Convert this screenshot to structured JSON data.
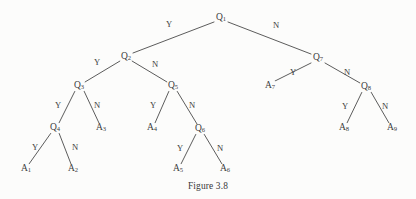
{
  "figure": {
    "caption": "Figure 3.8",
    "type": "binary-decision-tree",
    "background_color": "#fcfcfb",
    "line_color": "#4a4a4a",
    "text_color": "#3d3d3d",
    "width": 416,
    "height": 199
  },
  "nodes": [
    {
      "id": "q1",
      "label": "Q",
      "sub": "1",
      "kind": "question",
      "x": 221,
      "y": 18
    },
    {
      "id": "q2",
      "label": "Q",
      "sub": "2",
      "kind": "question",
      "x": 126,
      "y": 57
    },
    {
      "id": "q3",
      "label": "Q",
      "sub": "3",
      "kind": "question",
      "x": 79,
      "y": 86
    },
    {
      "id": "q4",
      "label": "Q",
      "sub": "4",
      "kind": "question",
      "x": 55,
      "y": 128
    },
    {
      "id": "q5",
      "label": "Q",
      "sub": "5",
      "kind": "question",
      "x": 173,
      "y": 86
    },
    {
      "id": "q6",
      "label": "Q",
      "sub": "6",
      "kind": "question",
      "x": 200,
      "y": 129
    },
    {
      "id": "q7",
      "label": "Q",
      "sub": "7",
      "kind": "question",
      "x": 318,
      "y": 58
    },
    {
      "id": "q8",
      "label": "Q",
      "sub": "8",
      "kind": "question",
      "x": 366,
      "y": 87
    },
    {
      "id": "a1",
      "label": "A",
      "sub": "1",
      "kind": "answer",
      "x": 26,
      "y": 169
    },
    {
      "id": "a2",
      "label": "A",
      "sub": "2",
      "kind": "answer",
      "x": 73,
      "y": 169
    },
    {
      "id": "a3",
      "label": "A",
      "sub": "3",
      "kind": "answer",
      "x": 101,
      "y": 128
    },
    {
      "id": "a4",
      "label": "A",
      "sub": "4",
      "kind": "answer",
      "x": 152,
      "y": 128
    },
    {
      "id": "a5",
      "label": "A",
      "sub": "5",
      "kind": "answer",
      "x": 178,
      "y": 169
    },
    {
      "id": "a6",
      "label": "A",
      "sub": "6",
      "kind": "answer",
      "x": 225,
      "y": 169
    },
    {
      "id": "a7",
      "label": "A",
      "sub": "7",
      "kind": "answer",
      "x": 270,
      "y": 86
    },
    {
      "id": "a8",
      "label": "A",
      "sub": "8",
      "kind": "answer",
      "x": 344,
      "y": 128
    },
    {
      "id": "a9",
      "label": "A",
      "sub": "9",
      "kind": "answer",
      "x": 392,
      "y": 128
    }
  ],
  "edges": [
    {
      "id": "e-q1-q2",
      "from": "q1",
      "to": "q2",
      "label": "Y",
      "lx": 169,
      "ly": 24,
      "x1": 214,
      "y1": 22,
      "x2": 133,
      "y2": 53
    },
    {
      "id": "e-q1-q7",
      "from": "q1",
      "to": "q7",
      "label": "N",
      "lx": 276,
      "ly": 25,
      "x1": 228,
      "y1": 22,
      "x2": 311,
      "y2": 54
    },
    {
      "id": "e-q2-q3",
      "from": "q2",
      "to": "q3",
      "label": "Y",
      "lx": 97,
      "ly": 62,
      "x1": 120,
      "y1": 61,
      "x2": 85,
      "y2": 82
    },
    {
      "id": "e-q2-q5",
      "from": "q2",
      "to": "q5",
      "label": "N",
      "lx": 155,
      "ly": 64,
      "x1": 132,
      "y1": 61,
      "x2": 167,
      "y2": 82
    },
    {
      "id": "e-q3-q4",
      "from": "q3",
      "to": "q4",
      "label": "Y",
      "lx": 58,
      "ly": 105,
      "x1": 75,
      "y1": 91,
      "x2": 59,
      "y2": 123
    },
    {
      "id": "e-q3-a3",
      "from": "q3",
      "to": "a3",
      "label": "N",
      "lx": 97,
      "ly": 105,
      "x1": 84,
      "y1": 91,
      "x2": 99,
      "y2": 123
    },
    {
      "id": "e-q4-a1",
      "from": "q4",
      "to": "a1",
      "label": "Y",
      "lx": 35,
      "ly": 147,
      "x1": 51,
      "y1": 133,
      "x2": 29,
      "y2": 164
    },
    {
      "id": "e-q4-a2",
      "from": "q4",
      "to": "a2",
      "label": "N",
      "lx": 75,
      "ly": 147,
      "x1": 59,
      "y1": 133,
      "x2": 71,
      "y2": 164
    },
    {
      "id": "e-q5-a4",
      "from": "q5",
      "to": "a4",
      "label": "Y",
      "lx": 153,
      "ly": 105,
      "x1": 169,
      "y1": 91,
      "x2": 155,
      "y2": 123
    },
    {
      "id": "e-q5-q6",
      "from": "q5",
      "to": "q6",
      "label": "N",
      "lx": 192,
      "ly": 105,
      "x1": 177,
      "y1": 91,
      "x2": 197,
      "y2": 124
    },
    {
      "id": "e-q6-a5",
      "from": "q6",
      "to": "a5",
      "label": "Y",
      "lx": 180,
      "ly": 148,
      "x1": 196,
      "y1": 134,
      "x2": 181,
      "y2": 164
    },
    {
      "id": "e-q6-a6",
      "from": "q6",
      "to": "a6",
      "label": "N",
      "lx": 220,
      "ly": 148,
      "x1": 204,
      "y1": 134,
      "x2": 222,
      "y2": 164
    },
    {
      "id": "e-q7-a7",
      "from": "q7",
      "to": "a7",
      "label": "Y",
      "lx": 293,
      "ly": 72,
      "x1": 311,
      "y1": 63,
      "x2": 275,
      "y2": 81
    },
    {
      "id": "e-q7-q8",
      "from": "q7",
      "to": "q8",
      "label": "N",
      "lx": 347,
      "ly": 72,
      "x1": 325,
      "y1": 63,
      "x2": 360,
      "y2": 83
    },
    {
      "id": "e-q8-a8",
      "from": "q8",
      "to": "a8",
      "label": "Y",
      "lx": 345,
      "ly": 106,
      "x1": 362,
      "y1": 92,
      "x2": 347,
      "y2": 123
    },
    {
      "id": "e-q8-a9",
      "from": "q8",
      "to": "a9",
      "label": "N",
      "lx": 385,
      "ly": 106,
      "x1": 371,
      "y1": 92,
      "x2": 389,
      "y2": 123
    }
  ]
}
